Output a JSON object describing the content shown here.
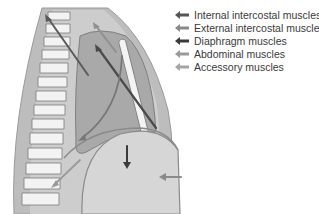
{
  "legend": {
    "items": [
      {
        "label": "Internal intercostal muscles",
        "color": "#555555"
      },
      {
        "label": "External intercostal muscles",
        "color": "#8a8a8a"
      },
      {
        "label": "Diaphragm muscles",
        "color": "#3a3a3a"
      },
      {
        "label": "Abdominal muscles",
        "color": "#9a9a9a"
      },
      {
        "label": "Accessory muscles",
        "color": "#a5a5a5"
      }
    ]
  },
  "colors": {
    "body_outline": "#b9b9b9",
    "thorax_fill": "#c9c9c9",
    "lung_fill": "#b0b0b0",
    "abdomen_fill": "#d4d4d4",
    "vertebra_fill": "#f2f2f2"
  }
}
